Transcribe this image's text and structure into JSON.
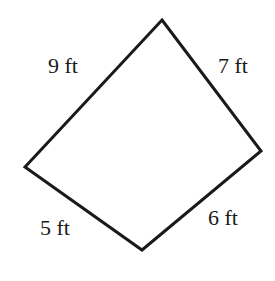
{
  "diagram": {
    "shape": "quadrilateral",
    "vertices": {
      "top": [
        162,
        20
      ],
      "right": [
        261,
        151
      ],
      "bottom": [
        142,
        250
      ],
      "left": [
        25,
        167
      ]
    },
    "stroke_color": "#1a1a1a",
    "sides": [
      {
        "id": "top-left",
        "label": "9 ft"
      },
      {
        "id": "top-right",
        "label": "7 ft"
      },
      {
        "id": "bottom-left",
        "label": "5 ft"
      },
      {
        "id": "bottom-right",
        "label": "6 ft"
      }
    ]
  }
}
